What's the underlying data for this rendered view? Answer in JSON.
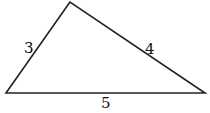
{
  "diagram": {
    "type": "triangle",
    "vertices": {
      "top": [
        70,
        2
      ],
      "left": [
        6,
        93
      ],
      "right": [
        205,
        93
      ]
    },
    "stroke_color": "#222222",
    "sides": [
      {
        "id": "left",
        "label": "3"
      },
      {
        "id": "right",
        "label": "4"
      },
      {
        "id": "bottom",
        "label": "5"
      }
    ]
  }
}
